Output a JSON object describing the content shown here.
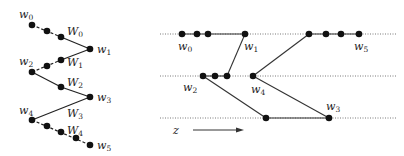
{
  "left_diagram": {
    "labels": {
      "w0": {
        "base": "w",
        "sub": "0"
      },
      "w1": {
        "base": "w",
        "sub": "1"
      },
      "w2": {
        "base": "w",
        "sub": "2"
      },
      "w3": {
        "base": "w",
        "sub": "3"
      },
      "w4": {
        "base": "w",
        "sub": "4"
      },
      "w5": {
        "base": "w",
        "sub": "5"
      },
      "W0": {
        "base": "W",
        "sub": "0"
      },
      "W1": {
        "base": "W",
        "sub": "1"
      },
      "W2": {
        "base": "W",
        "sub": "2"
      },
      "W3": {
        "base": "W",
        "sub": "3"
      },
      "W4": {
        "base": "W",
        "sub": "4"
      }
    }
  },
  "right_diagram": {
    "labels": {
      "w0": {
        "base": "w",
        "sub": "0"
      },
      "w1": {
        "base": "w",
        "sub": "1"
      },
      "w2": {
        "base": "w",
        "sub": "2"
      },
      "w3": {
        "base": "w",
        "sub": "3"
      },
      "w4": {
        "base": "w",
        "sub": "4"
      },
      "w5": {
        "base": "w",
        "sub": "5"
      }
    },
    "axis_label": "z",
    "levels": 3
  },
  "colors": {
    "ink": "#111111",
    "line": "#333333",
    "dotted": "#555555"
  }
}
